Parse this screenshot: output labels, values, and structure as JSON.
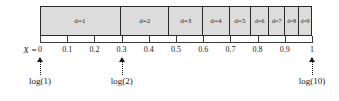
{
  "figure": {
    "name": "benford-first-digit-logarithmic-scale",
    "bar": {
      "segments": [
        {
          "label": "d=1",
          "start": 0.0,
          "end": 0.301
        },
        {
          "label": "d=2",
          "start": 0.301,
          "end": 0.4771
        },
        {
          "label": "d=3",
          "start": 0.4771,
          "end": 0.6021
        },
        {
          "label": "d=4",
          "start": 0.6021,
          "end": 0.699
        },
        {
          "label": "d=5",
          "start": 0.699,
          "end": 0.7782
        },
        {
          "label": "d=6",
          "start": 0.7782,
          "end": 0.8451
        },
        {
          "label": "d=7",
          "start": 0.8451,
          "end": 0.9031
        },
        {
          "label": "d=8",
          "start": 0.9031,
          "end": 0.9542
        },
        {
          "label": "d=9",
          "start": 0.9542,
          "end": 1.0
        }
      ]
    },
    "axis": {
      "variable_label": "X =",
      "min": 0,
      "max": 1,
      "ticks": [
        {
          "value": 0,
          "label": "0"
        },
        {
          "value": 0.1,
          "label": "0.1"
        },
        {
          "value": 0.2,
          "label": "0.2"
        },
        {
          "value": 0.3,
          "label": "0.3"
        },
        {
          "value": 0.4,
          "label": "0.4"
        },
        {
          "value": 0.5,
          "label": "0.5"
        },
        {
          "value": 0.6,
          "label": "0.6"
        },
        {
          "value": 0.7,
          "label": "0.7"
        },
        {
          "value": 0.8,
          "label": "0.8"
        },
        {
          "value": 0.9,
          "label": "0.9"
        },
        {
          "value": 1.0,
          "label": "1"
        }
      ]
    },
    "callouts": [
      {
        "value": 0.0,
        "label": "log(1)"
      },
      {
        "value": 0.301,
        "label": "log(2)"
      },
      {
        "value": 1.0,
        "label": "log(10)"
      }
    ],
    "colors": {
      "bar_fill": "#dcdcdc",
      "bar_stroke": "#2b2b2b",
      "axis_stroke": "#3a3a3a",
      "text": "#1a1a1a",
      "background": "#ffffff"
    }
  },
  "chart_data": {
    "type": "bar",
    "title": "",
    "xlabel": "X",
    "ylabel": "",
    "xlim": [
      0,
      1
    ],
    "grid": false,
    "legend": null,
    "orientation": "horizontal-stacked",
    "categories": [
      "d=1",
      "d=2",
      "d=3",
      "d=4",
      "d=5",
      "d=6",
      "d=7",
      "d=8",
      "d=9"
    ],
    "values": [
      0.301,
      0.1761,
      0.1249,
      0.0969,
      0.0792,
      0.0669,
      0.058,
      0.0512,
      0.0458
    ],
    "cumulative_boundaries": [
      0.0,
      0.301,
      0.4771,
      0.6021,
      0.699,
      0.7782,
      0.8451,
      0.9031,
      0.9542,
      1.0
    ],
    "tick_labels": [
      "0",
      "0.1",
      "0.2",
      "0.3",
      "0.4",
      "0.5",
      "0.6",
      "0.7",
      "0.8",
      "0.9",
      "1"
    ],
    "annotations": [
      {
        "x": 0.0,
        "text": "log(1)"
      },
      {
        "x": 0.301,
        "text": "log(2)"
      },
      {
        "x": 1.0,
        "text": "log(10)"
      }
    ]
  }
}
